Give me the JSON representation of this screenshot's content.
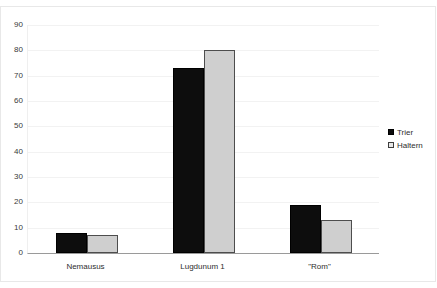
{
  "chart_data": {
    "type": "bar",
    "title": "",
    "subtitle": "",
    "xlabel": "",
    "ylabel": "",
    "categories": [
      "Nemausus",
      "Lugdunum 1",
      "\"Rom\""
    ],
    "series": [
      {
        "name": "Trier",
        "color": "#0d0d0d",
        "values": [
          8,
          73,
          19
        ]
      },
      {
        "name": "Haltern",
        "color": "#cfcfcf",
        "values": [
          7,
          80,
          13
        ]
      }
    ],
    "ylim": [
      0,
      90
    ],
    "yticks": [
      0,
      10,
      20,
      30,
      40,
      50,
      60,
      70,
      80,
      90
    ],
    "ytick_labels": [
      "0",
      "10",
      "20",
      "30",
      "40",
      "50",
      "60",
      "70",
      "80",
      "90"
    ],
    "grid": true,
    "grid_axis": "y",
    "legend_position": "right",
    "legend": [
      "Trier",
      "Haltern"
    ],
    "annotations": [],
    "plot_background": "#ffffff"
  }
}
